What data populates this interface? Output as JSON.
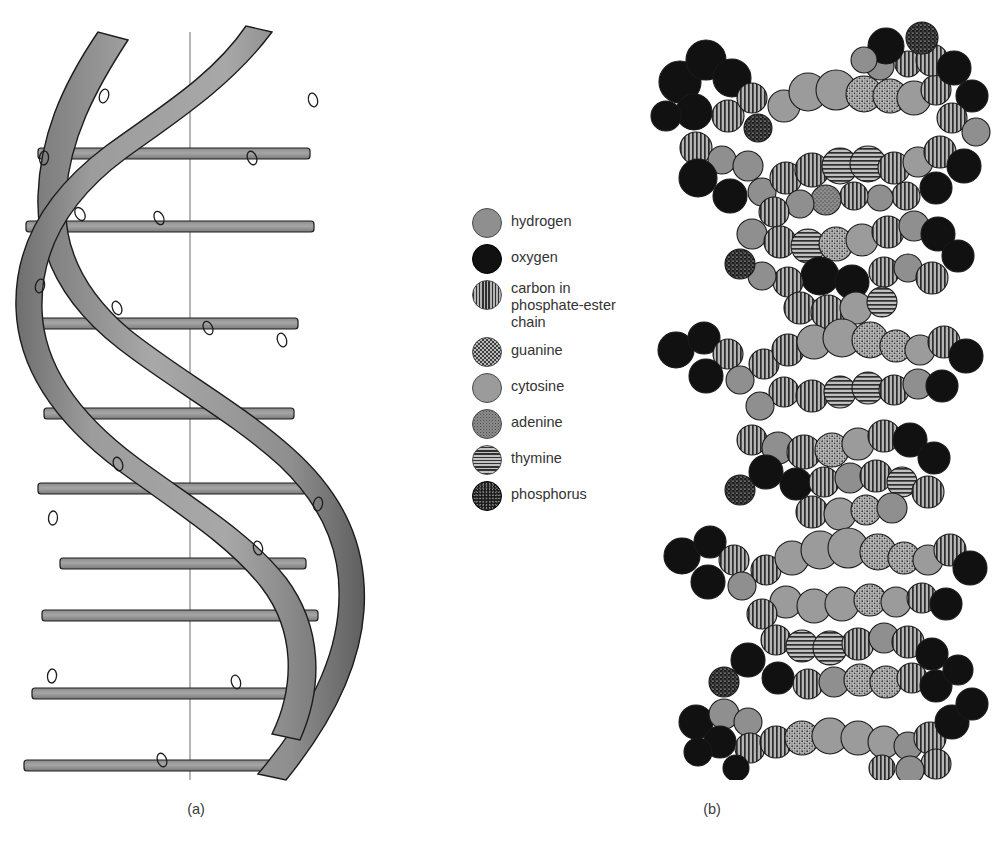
{
  "figure": {
    "background_color": "#ffffff",
    "panels": [
      {
        "id": "a",
        "caption": "(a)",
        "kind": "ribbon-double-helix"
      },
      {
        "id": "b",
        "caption": "(b)",
        "kind": "space-filling-model"
      }
    ]
  },
  "legend": {
    "items": [
      {
        "key": "hydrogen",
        "label": "hydrogen",
        "swatch": "plain-light-gray-circle",
        "color": "#8f8f8f"
      },
      {
        "key": "oxygen",
        "label": "oxygen",
        "swatch": "solid-black-circle",
        "color": "#111111"
      },
      {
        "key": "carbon",
        "label": "carbon in\nphosphate-ester\nchain",
        "swatch": "vertical-stripe-circle",
        "color": "#2f2f2f"
      },
      {
        "key": "guanine",
        "label": "guanine",
        "swatch": "coarse-stipple-circle",
        "color": "#b9b9b9"
      },
      {
        "key": "cytosine",
        "label": "cytosine",
        "swatch": "plain-gray-circle",
        "color": "#9b9b9b"
      },
      {
        "key": "adenine",
        "label": "adenine",
        "swatch": "fine-stipple-circle",
        "color": "#8d8d8d"
      },
      {
        "key": "thymine",
        "label": "thymine",
        "swatch": "horizontal-stripe-circle",
        "color": "#323232"
      },
      {
        "key": "phosphorus",
        "label": "phosphorus",
        "swatch": "dark-stipple-circle",
        "color": "#1d1d1d"
      }
    ]
  },
  "helix_diagram": {
    "axis_x": 190,
    "turns": 4,
    "ribbon_color": "#9a9a9a",
    "ribbon_outline": "#1c1c1c",
    "rung_color": "#9a9a9a",
    "axis_color": "#777777",
    "rung_count": 17,
    "marker_shape": "small-oval",
    "marker_count": 16
  },
  "spacefill_model": {
    "atom_count": 420,
    "helical_turns": 4,
    "groove_count": 7,
    "outline_color": "#1a1a1a",
    "palette": {
      "hydrogen": "#8f8f8f",
      "oxygen": "#111111",
      "carbon": "#2f2f2f",
      "guanine": "#b9b9b9",
      "cytosine": "#9b9b9b",
      "adenine": "#8d8d8d",
      "thymine": "#323232",
      "phosphorus": "#1d1d1d"
    }
  }
}
